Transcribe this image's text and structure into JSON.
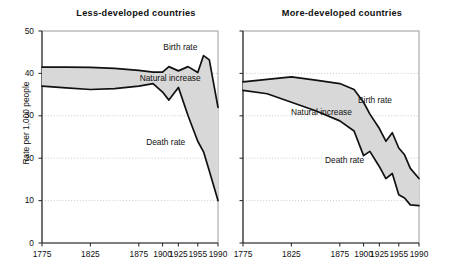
{
  "figure": {
    "ylabel": "Rate per 1,000 people",
    "colors": {
      "band_fill": "#d8d8d8",
      "curve": "#111111",
      "frame": "#9a9a9a",
      "gridline": "#bdbdbd",
      "text": "#111111"
    }
  },
  "axes": {
    "y_ticks": [
      "0",
      "10",
      "20",
      "30",
      "40",
      "50"
    ],
    "x_ticks": [
      "1775",
      "1825",
      "1875",
      "1900",
      "1925",
      "1955",
      "1990"
    ]
  },
  "chart_data": [
    {
      "type": "area",
      "title": "Less-developed countries",
      "xlabel": "",
      "ylabel": "Rate per 1,000 people",
      "ylim": [
        0,
        50
      ],
      "grid": true,
      "legend_position": "inline-annotations",
      "x": [
        1775,
        1800,
        1825,
        1850,
        1875,
        1890,
        1900,
        1910,
        1925,
        1940,
        1955,
        1965,
        1975,
        1990
      ],
      "x_ticks": [
        1775,
        1825,
        1875,
        1900,
        1925,
        1955,
        1990
      ],
      "y_ticks": [
        0,
        10,
        20,
        30,
        40,
        50
      ],
      "series": [
        {
          "name": "Birth rate",
          "values": [
            41.5,
            41.5,
            41.4,
            41.2,
            40.7,
            40.3,
            40.3,
            41.6,
            40.6,
            41.6,
            40.2,
            44.2,
            43.2,
            32.0
          ]
        },
        {
          "name": "Death rate",
          "values": [
            37.0,
            36.6,
            36.2,
            36.4,
            37.0,
            37.6,
            35.6,
            33.7,
            36.7,
            30.0,
            24.0,
            21.5,
            17.0,
            10.0
          ]
        }
      ],
      "band": {
        "name": "Natural increase",
        "description": "Shaded area between birth rate and death rate"
      },
      "annotations": [
        {
          "text": "Birth rate",
          "x": 1928,
          "y": 46.0
        },
        {
          "text": "Natural increase",
          "x": 1912,
          "y": 38.6
        },
        {
          "text": "Death rate",
          "x": 1905,
          "y": 23.6
        }
      ]
    },
    {
      "type": "area",
      "title": "More-developed countries",
      "xlabel": "",
      "ylabel": "Rate per 1,000 people",
      "ylim": [
        0,
        50
      ],
      "grid": true,
      "legend_position": "inline-annotations",
      "x": [
        1775,
        1800,
        1825,
        1850,
        1875,
        1890,
        1900,
        1910,
        1925,
        1935,
        1945,
        1955,
        1965,
        1975,
        1990
      ],
      "x_ticks": [
        1775,
        1825,
        1875,
        1900,
        1925,
        1955,
        1990
      ],
      "y_ticks": [
        0,
        10,
        20,
        30,
        40,
        50
      ],
      "series": [
        {
          "name": "Birth rate",
          "values": [
            38.0,
            38.6,
            39.2,
            38.4,
            37.6,
            36.2,
            33.2,
            30.4,
            27.0,
            24.0,
            26.0,
            22.4,
            20.8,
            17.6,
            15.2
          ]
        },
        {
          "name": "Death rate",
          "values": [
            36.0,
            35.2,
            33.2,
            31.2,
            28.8,
            26.4,
            20.6,
            21.6,
            18.0,
            15.2,
            16.4,
            11.4,
            10.6,
            9.0,
            8.8
          ]
        }
      ],
      "band": {
        "name": "Natural increase",
        "description": "Shaded area between birth rate and death rate"
      },
      "annotations": [
        {
          "text": "Birth rate",
          "x": 1918,
          "y": 33.4
        },
        {
          "text": "Natural increase",
          "x": 1856,
          "y": 30.6
        },
        {
          "text": "Death rate",
          "x": 1880,
          "y": 19.4
        }
      ]
    }
  ]
}
